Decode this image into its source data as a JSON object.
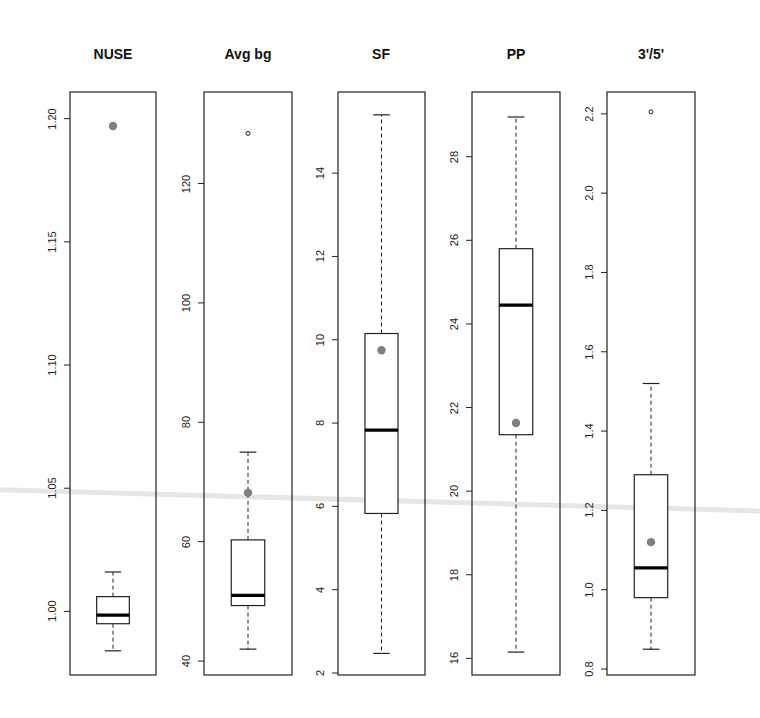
{
  "figure": {
    "type": "boxplot-grid",
    "panel_count": 5
  },
  "colors": {
    "axis": "#222222",
    "box": "#222222",
    "median": "#000000",
    "mean_dot": "#808080",
    "outlier": "#222222",
    "background": "#ffffff"
  },
  "chart_data": [
    {
      "type": "boxplot",
      "title": "NUSE",
      "xlabel": "",
      "ylabel": "",
      "ylim": [
        0.975,
        1.21
      ],
      "yticks": [
        1.0,
        1.05,
        1.1,
        1.15,
        1.2
      ],
      "ytick_labels": [
        "1.00",
        "1.05",
        "1.10",
        "1.15",
        "1.20"
      ],
      "whisker_low": 0.984,
      "q1": 0.995,
      "median": 0.9985,
      "q3": 1.006,
      "whisker_high": 1.016,
      "mean": 1.197,
      "outliers": []
    },
    {
      "type": "boxplot",
      "title": "Avg bg",
      "xlabel": "",
      "ylabel": "",
      "ylim": [
        38,
        135
      ],
      "yticks": [
        40,
        60,
        80,
        100,
        120
      ],
      "ytick_labels": [
        "40",
        "60",
        "80",
        "100",
        "120"
      ],
      "whisker_low": 42,
      "q1": 49.3,
      "median": 51,
      "q3": 60.3,
      "whisker_high": 75,
      "mean": 68.2,
      "outliers": [
        128.4
      ]
    },
    {
      "type": "boxplot",
      "title": "SF",
      "xlabel": "",
      "ylabel": "",
      "ylim": [
        2.0,
        15.9
      ],
      "yticks": [
        2,
        4,
        6,
        8,
        10,
        12,
        14
      ],
      "ytick_labels": [
        "2",
        "4",
        "6",
        "8",
        "10",
        "12",
        "14"
      ],
      "whisker_low": 2.47,
      "q1": 5.83,
      "median": 7.83,
      "q3": 10.15,
      "whisker_high": 15.4,
      "mean": 9.75,
      "outliers": []
    },
    {
      "type": "boxplot",
      "title": "PP",
      "xlabel": "",
      "ylabel": "",
      "ylim": [
        15.65,
        29.5
      ],
      "yticks": [
        16,
        18,
        20,
        22,
        24,
        26,
        28
      ],
      "ytick_labels": [
        "16",
        "18",
        "20",
        "22",
        "24",
        "26",
        "28"
      ],
      "whisker_low": 16.15,
      "q1": 21.35,
      "median": 24.45,
      "q3": 25.8,
      "whisker_high": 28.95,
      "mean": 21.63,
      "outliers": []
    },
    {
      "type": "boxplot",
      "title": "3'/5'",
      "xlabel": "",
      "ylabel": "",
      "ylim": [
        0.79,
        2.25
      ],
      "yticks": [
        0.8,
        1.0,
        1.2,
        1.4,
        1.6,
        1.8,
        2.0,
        2.2
      ],
      "ytick_labels": [
        "0.8",
        "1.0",
        "1.2",
        "1.4",
        "1.6",
        "1.8",
        "2.0",
        "2.2"
      ],
      "whisker_low": 0.85,
      "q1": 0.98,
      "median": 1.055,
      "q3": 1.29,
      "whisker_high": 1.52,
      "mean": 1.12,
      "outliers": [
        2.205
      ]
    }
  ],
  "layout": {
    "panels": [
      {
        "left": 70,
        "right": 156,
        "top": 92,
        "bottom": 675,
        "title_x": 113
      },
      {
        "left": 204,
        "right": 292,
        "top": 92,
        "bottom": 675,
        "title_x": 248
      },
      {
        "left": 338,
        "right": 425,
        "top": 92,
        "bottom": 675,
        "title_x": 381
      },
      {
        "left": 472,
        "right": 560,
        "top": 92,
        "bottom": 675,
        "title_x": 516
      },
      {
        "left": 607,
        "right": 695,
        "top": 92,
        "bottom": 675,
        "title_x": 651
      }
    ],
    "title_y": 46
  }
}
